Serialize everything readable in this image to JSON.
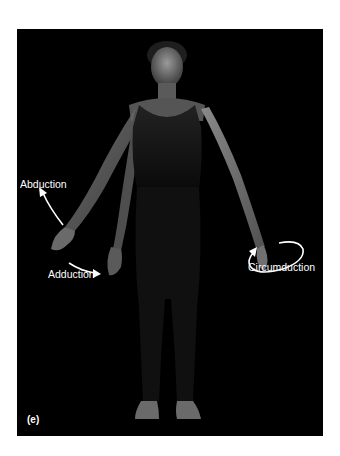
{
  "figure": {
    "panel_letter": "(e)",
    "labels": {
      "abduction": "Abduction",
      "adduction": "Adduction",
      "circumduction": "Circumduction"
    },
    "arrows": [
      {
        "name": "abduction-arrow",
        "direction": "up-left"
      },
      {
        "name": "adduction-arrow",
        "direction": "down-right"
      },
      {
        "name": "circumduction-arrow",
        "direction": "circular"
      }
    ],
    "colors": {
      "background": "#000000",
      "page": "#ffffff",
      "label": "#ffffff",
      "skin_highlight": "#8a8a8a",
      "clothing": "#1a1a1a"
    }
  }
}
